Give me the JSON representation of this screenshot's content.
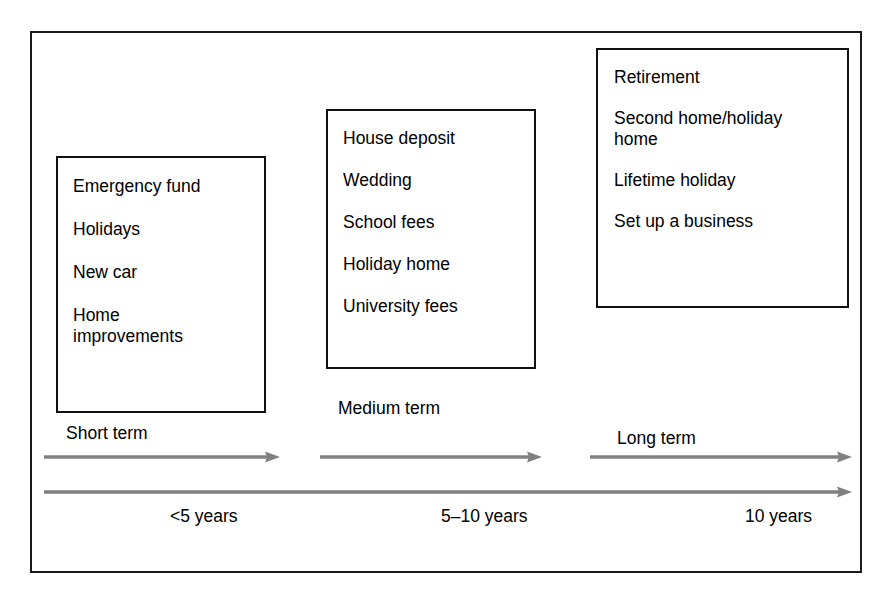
{
  "diagram": {
    "colors": {
      "frame_border": "#1a1a1a",
      "box_border": "#111111",
      "arrow": "#808080",
      "text": "#000000",
      "background": "#ffffff"
    },
    "horizons": [
      {
        "key": "short",
        "term_label": "Short term",
        "duration_label": "<5 years",
        "goals": [
          "Emergency fund",
          "Holidays",
          "New car",
          "Home\nimprovements"
        ]
      },
      {
        "key": "medium",
        "term_label": "Medium term",
        "duration_label": "5–10 years",
        "goals": [
          "House deposit",
          "Wedding",
          "School fees",
          "Holiday home",
          "University fees"
        ]
      },
      {
        "key": "long",
        "term_label": "Long term",
        "duration_label": "10 years",
        "goals": [
          "Retirement",
          "Second home/holiday\nhome",
          "Lifetime holiday",
          "Set up a business"
        ]
      }
    ],
    "arrows": [
      {
        "key": "short-arrow",
        "direction": "right",
        "spans": "Short term"
      },
      {
        "key": "medium-arrow",
        "direction": "right",
        "spans": "Medium term"
      },
      {
        "key": "long-arrow",
        "direction": "right",
        "spans": "Long term"
      },
      {
        "key": "timeline-arrow",
        "direction": "right",
        "spans": "Full timeline"
      }
    ]
  }
}
